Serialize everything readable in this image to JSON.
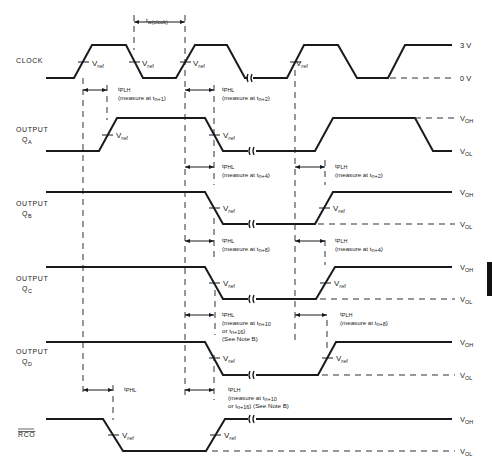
{
  "diagram": {
    "type": "timing-diagram",
    "signals": [
      {
        "id": "clock",
        "label_line1": "CLOCK",
        "label_line2": ""
      },
      {
        "id": "qa",
        "label_line1": "OUTPUT",
        "label_line2": "Q",
        "label_sub": "A"
      },
      {
        "id": "qb",
        "label_line1": "OUTPUT",
        "label_line2": "Q",
        "label_sub": "B"
      },
      {
        "id": "qc",
        "label_line1": "OUTPUT",
        "label_line2": "Q",
        "label_sub": "C"
      },
      {
        "id": "qd",
        "label_line1": "OUTPUT",
        "label_line2": "Q",
        "label_sub": "D"
      },
      {
        "id": "rco",
        "label_line1": "RCO",
        "label_line2": "",
        "overbar": true
      }
    ],
    "rails": {
      "clock_high": "3 V",
      "clock_low": "0 V",
      "voh_main": "V",
      "voh_sub": "OH",
      "vol_main": "V",
      "vol_sub": "OL"
    },
    "vref": {
      "main": "V",
      "sub": "ref"
    },
    "pulse_width": {
      "main": "t",
      "sub": "w(clock)"
    },
    "timings": {
      "clk_qa_plh": {
        "t": "t",
        "sub": "PLH",
        "note": "(measure at t",
        "note_sub": "n+1",
        "note_end": ")"
      },
      "clk_qa_phl": {
        "t": "t",
        "sub": "PHL",
        "note": "(measure at t",
        "note_sub": "n+2",
        "note_end": ")"
      },
      "qb_phl": {
        "t": "t",
        "sub": "PHL",
        "note": "(measure at t",
        "note_sub": "n+4",
        "note_end": ")"
      },
      "qa_plh2": {
        "t": "t",
        "sub": "PLH",
        "note": "(measure at t",
        "note_sub": "n+2",
        "note_end": ")"
      },
      "qc_phl": {
        "t": "t",
        "sub": "PHL",
        "note": "(measure at t",
        "note_sub": "n+8",
        "note_end": ")"
      },
      "qb_plh": {
        "t": "t",
        "sub": "PLH",
        "note": "(measure at t",
        "note_sub": "n+4",
        "note_end": ")"
      },
      "qd_phl": {
        "t": "t",
        "sub": "PHL",
        "note": "(measure at t",
        "note_sub": "n+10",
        "note2": "or t",
        "note2_sub": "n+16",
        "note2_end": ")",
        "note3": "(See Note B)"
      },
      "qc_plh": {
        "t": "t",
        "sub": "PLH",
        "note": "(measure at t",
        "note_sub": "n+8",
        "note_end": ")"
      },
      "rco_phl": {
        "t": "t",
        "sub": "PHL"
      },
      "rco_plh": {
        "t": "t",
        "sub": "PLH",
        "note": "(measure at t",
        "note_sub": "n+10",
        "note2": "or t",
        "note2_sub": "n+16",
        "note2_end": ") (See Note B)"
      }
    }
  }
}
